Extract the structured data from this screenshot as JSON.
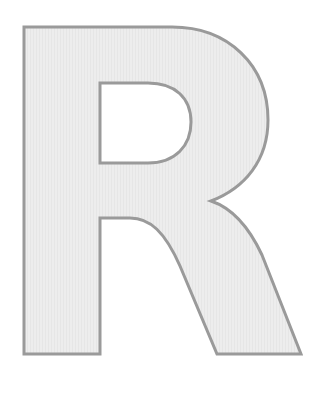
{
  "image": {
    "letter": "R",
    "fill_color": "#ececec",
    "stroke_color": "#9a9a9a",
    "background": "#ffffff"
  }
}
